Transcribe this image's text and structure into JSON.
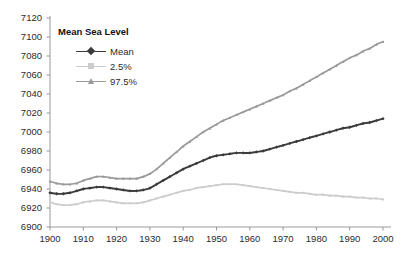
{
  "chart_data": {
    "type": "line",
    "title": "",
    "xlabel": "",
    "ylabel": "",
    "xlim": [
      1900,
      2000
    ],
    "ylim": [
      6900,
      7120
    ],
    "grid": false,
    "legend_position": "top-left",
    "legend_title": "Mean Sea Level",
    "xticks": [
      "1900",
      "1910",
      "1920",
      "1930",
      "1940",
      "1950",
      "1960",
      "1970",
      "1980",
      "1990",
      "2000"
    ],
    "yticks": [
      "6900",
      "6920",
      "6940",
      "6960",
      "6980",
      "7000",
      "7020",
      "7040",
      "7060",
      "7080",
      "7100",
      "7120"
    ],
    "x": [
      1900,
      1902,
      1904,
      1906,
      1908,
      1910,
      1912,
      1914,
      1916,
      1918,
      1920,
      1922,
      1924,
      1926,
      1928,
      1930,
      1932,
      1934,
      1936,
      1938,
      1940,
      1942,
      1944,
      1946,
      1948,
      1950,
      1952,
      1954,
      1956,
      1958,
      1960,
      1962,
      1964,
      1966,
      1968,
      1970,
      1972,
      1974,
      1976,
      1978,
      1980,
      1982,
      1984,
      1986,
      1988,
      1990,
      1992,
      1994,
      1996,
      1998,
      2000
    ],
    "series": [
      {
        "name": "Mean",
        "color": "#3b3b3b",
        "marker": "diamond",
        "values": [
          6936,
          6935,
          6935,
          6936,
          6938,
          6940,
          6941,
          6942,
          6942,
          6941,
          6940,
          6939,
          6938,
          6938,
          6939,
          6941,
          6945,
          6949,
          6953,
          6957,
          6961,
          6964,
          6967,
          6970,
          6973,
          6975,
          6976,
          6977,
          6978,
          6978,
          6978,
          6979,
          6980,
          6982,
          6984,
          6986,
          6988,
          6990,
          6992,
          6994,
          6996,
          6998,
          7000,
          7002,
          7004,
          7005,
          7007,
          7009,
          7010,
          7012,
          7014
        ]
      },
      {
        "name": "2.5%",
        "color": "#cccccc",
        "marker": "square",
        "values": [
          6926,
          6924,
          6923,
          6923,
          6924,
          6926,
          6927,
          6928,
          6928,
          6927,
          6926,
          6925,
          6925,
          6925,
          6926,
          6928,
          6930,
          6932,
          6934,
          6936,
          6938,
          6939,
          6941,
          6942,
          6943,
          6944,
          6945,
          6945,
          6945,
          6944,
          6943,
          6942,
          6941,
          6940,
          6939,
          6938,
          6937,
          6936,
          6936,
          6935,
          6934,
          6934,
          6933,
          6933,
          6932,
          6932,
          6931,
          6931,
          6930,
          6930,
          6929
        ]
      },
      {
        "name": "97.5%",
        "color": "#9a9a9a",
        "marker": "triangle",
        "values": [
          6948,
          6946,
          6945,
          6945,
          6946,
          6949,
          6951,
          6953,
          6953,
          6952,
          6951,
          6951,
          6951,
          6951,
          6953,
          6956,
          6961,
          6967,
          6973,
          6979,
          6985,
          6990,
          6995,
          7000,
          7004,
          7008,
          7012,
          7015,
          7018,
          7021,
          7024,
          7027,
          7030,
          7033,
          7036,
          7039,
          7043,
          7046,
          7050,
          7054,
          7058,
          7062,
          7066,
          7070,
          7074,
          7078,
          7081,
          7085,
          7088,
          7092,
          7095
        ]
      }
    ]
  }
}
